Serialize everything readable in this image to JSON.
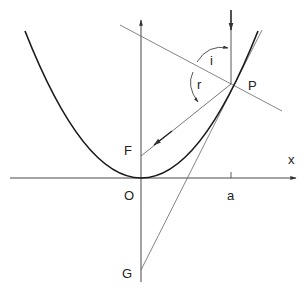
{
  "diagram": {
    "colors": {
      "curve": "#1a1a1a",
      "thin_line": "#555555",
      "axis": "#333333",
      "background": "#ffffff"
    },
    "labels": {
      "x_axis": "x",
      "origin": "O",
      "focus": "F",
      "point": "P",
      "tangent_intercept": "G",
      "tick_a": "a",
      "angle_incidence": "i",
      "angle_reflection": "r"
    },
    "elements": [
      "x-axis with arrow",
      "y-axis with arrow",
      "parabola through O",
      "incident vertical ray to P (arrow down)",
      "reflected ray from P to F (arrow toward F)",
      "tangent line at P through G",
      "normal line at P",
      "angle arc i between incident ray and normal",
      "angle arc r between normal and reflected ray"
    ]
  }
}
